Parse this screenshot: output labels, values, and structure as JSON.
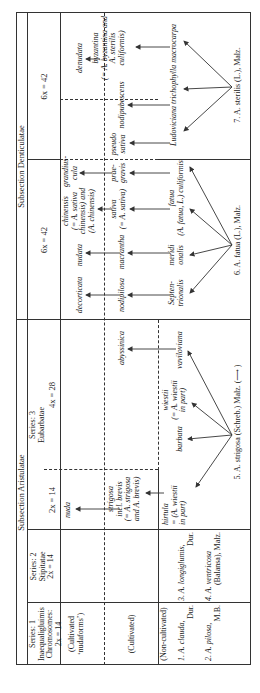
{
  "subsections": {
    "aristulatae": "Subsection Aristulatae",
    "denticulatae": "Subsection Denticulatae"
  },
  "series": {
    "s1": [
      "Series: 1",
      "Inaequaligluimis",
      "Chromosomes:",
      "2x = 14"
    ],
    "s2": [
      "Series: 2",
      "Stipitatae",
      "2x = 14"
    ],
    "s3": [
      "Series: 3",
      "Eubarbatae"
    ]
  },
  "ploidy": {
    "eub_2x": "2x = 14",
    "eub_4x": "4x = 28",
    "dent_6x_a": "6x = 42",
    "dent_6x_b": "6x = 42"
  },
  "row_labels": {
    "cult_nudaforms": [
      "(Cultivated",
      "‘nudaforms’)"
    ],
    "cultivated": "(Cultivated)",
    "non_cultivated": "(Non-cultivated)"
  },
  "nudaforms_row": {
    "nuda": "nuda",
    "decorticata": "decorticata",
    "nudata": "nudata",
    "chinensis": [
      "chinensis",
      "(= A. sativa",
      "chinensis) and",
      "(A. chinensis)"
    ],
    "grandiuscula": [
      "grandius-",
      "cula"
    ],
    "denudata": "denudata"
  },
  "cultivated_row": {
    "strigosa": [
      "strigosa",
      "incl. brevis",
      "(= A. strigosa",
      "and A. brevis)"
    ],
    "abyssinica": "abyssinica",
    "nodipilosa": "nodipilosa",
    "macrantha": "macrantha",
    "sativa": [
      "sativa",
      "(= A. sativa)"
    ],
    "praegravis": [
      "prae-",
      "gravis"
    ],
    "pseudosativa": [
      "pseudo",
      "sativa"
    ],
    "nodipubescens": "nodipubescens",
    "byzantina": [
      "byzantina",
      "(= A. byzantina and",
      "A. sterilis",
      "culiformis)"
    ]
  },
  "wild_row": {
    "s1_species": [
      "1.  A. clauda,",
      "Dur.",
      "2.  A. pilosa,",
      "M.B."
    ],
    "s2_species": [
      "3.  A. longiglumis,",
      "Dur.",
      "4.  A. ventricosa",
      "(Balansa), Malz."
    ],
    "hirtula": [
      "hirtula",
      "= (A. wiestii",
      "in part)"
    ],
    "barbata": "barbata",
    "wiestii": [
      "wiestii",
      "(= A. wiestii",
      "in part)"
    ],
    "vaviloviana": "vaviloviana",
    "strigosa_parent": "5.  A. strigosa (Schreb.) Malz. (⟶ )",
    "septentrionalis": [
      "Septen-",
      "trionalis"
    ],
    "meridionalis": [
      "meridi",
      "onalis"
    ],
    "fatua": [
      "fatua",
      "(A. fatua, L.) culiformis"
    ],
    "fatua_parent": "6.  A. fatua (L.), Malz.",
    "ludoviciana": "Ludoviciana trichophylla macrocarpa",
    "sterilis_parent": "7.  A. sterilis (L.), Malz."
  }
}
